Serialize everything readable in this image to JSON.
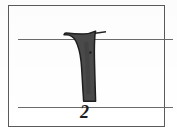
{
  "figure": {
    "kind": "calligraphy-stroke-exercise",
    "step_number": "2",
    "frame": {
      "border_color": "#5a5a5a",
      "background_color": "#ffffff"
    },
    "guide_lines": [
      {
        "name": "top-guide-line",
        "color": "#6b6b6b"
      },
      {
        "name": "bottom-guide-line",
        "color": "#6b6b6b"
      }
    ],
    "stroke": {
      "name": "vertical-stem-stroke",
      "description": "Downward vertical calligraphic stem with flag serif at top-left and a thin hairline tick extending to the right at the top, terminating flat on the bottom guide line",
      "fill_color": "#4a4a4a",
      "outline_color": "#1e1e1e"
    }
  }
}
